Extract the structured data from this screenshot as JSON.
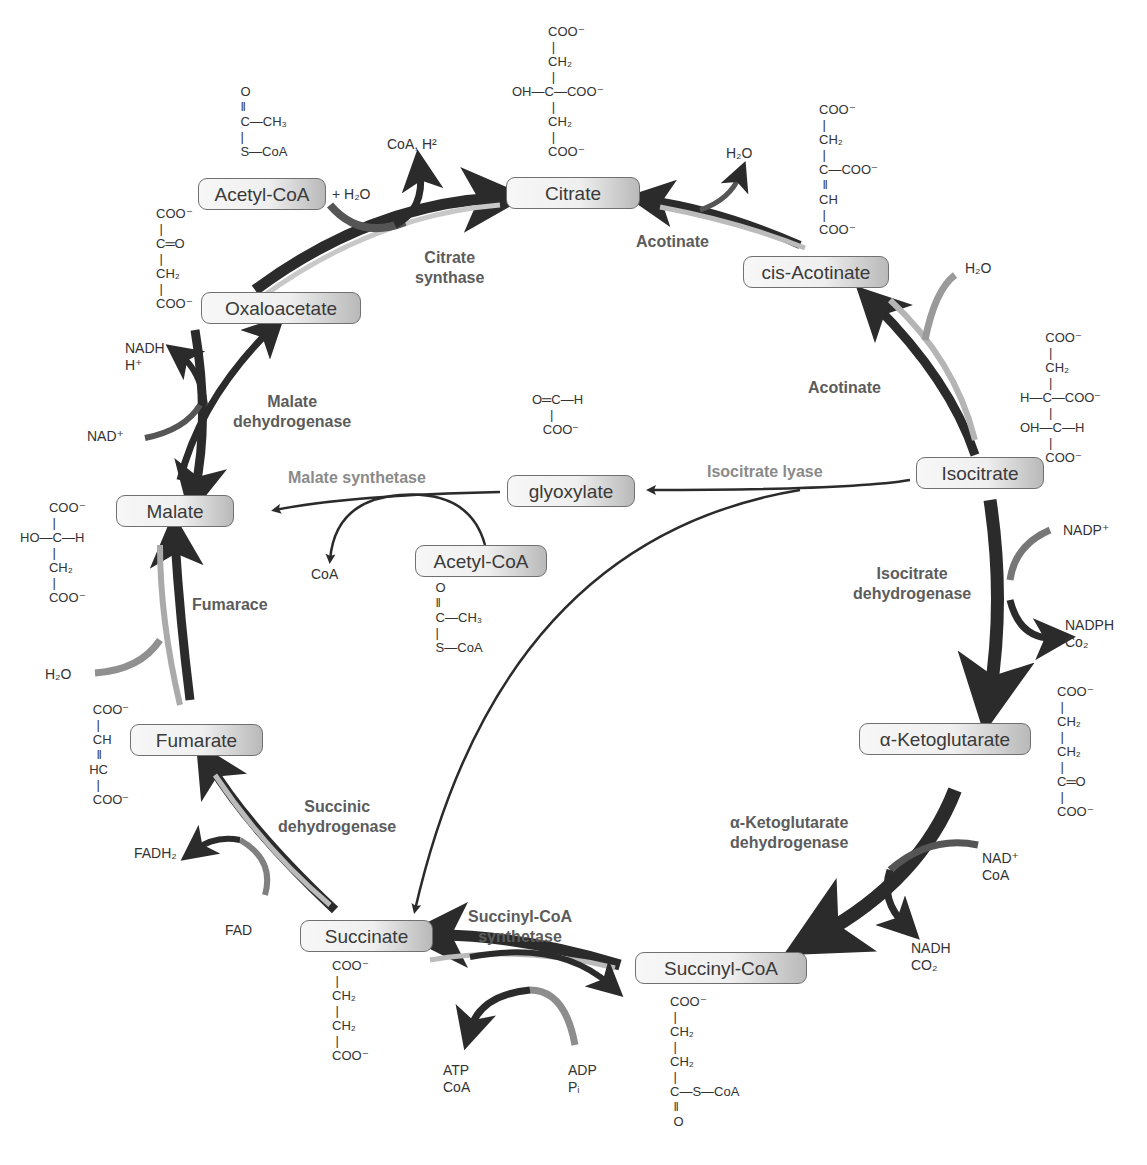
{
  "diagram": {
    "title_visible": false,
    "type": "metabolic-cycle"
  },
  "metabolites": {
    "acetyl_coa_top": "Acetyl-CoA",
    "citrate": "Citrate",
    "cis_acotinate": "cis-Acotinate",
    "isocitrate": "Isocitrate",
    "a_ketoglutarate": "α-Ketoglutarate",
    "succinyl_coa": "Succinyl-CoA",
    "succinate": "Succinate",
    "fumarate": "Fumarate",
    "malate": "Malate",
    "oxaloacetate": "Oxaloacetate",
    "glyoxylate": "glyoxylate",
    "acetyl_coa_mid": "Acetyl-CoA"
  },
  "enzymes": {
    "citrate_synthase": [
      "Citrate",
      "synthase"
    ],
    "acotinate_1": "Acotinate",
    "acotinate_2": "Acotinate",
    "isocitrate_dh": [
      "Isocitrate",
      "dehydrogenase"
    ],
    "akg_dh": [
      "α-Ketoglutarate",
      "dehydrogenase"
    ],
    "succinyl_coa_synthetase": [
      "Succinyl-CoA",
      "synthetase"
    ],
    "succinic_dh": [
      "Succinic",
      "dehydrogenase"
    ],
    "fumarace": "Fumarace",
    "malate_dh": [
      "Malate",
      "dehydrogenase"
    ],
    "malate_synthetase": "Malate synthetase",
    "isocitrate_lyase": "Isocitrate lyase"
  },
  "cofactors": {
    "plus_h2o": "+ H₂O",
    "coa_h": "CoA, H²",
    "h2o_citrate": "H₂O",
    "h2o_isocitrate": "H₂O",
    "nadp": "NADP⁺",
    "nadph": "NADPH",
    "co2_idh": "Co₂",
    "nad_akg": "NAD⁺",
    "coa_akg": "CoA",
    "nadh_akg": "NADH",
    "co2_akg": "CO₂",
    "atp": "ATP",
    "coa_scs": "CoA",
    "adp": "ADP",
    "pi": "Pᵢ",
    "fadh2": "FADH₂",
    "fad": "FAD",
    "h2o_fum": "H₂O",
    "nad_mdh": "NAD⁺",
    "nadh_mdh": "NADH",
    "h_mdh": "H⁺",
    "coa_ms": "CoA"
  },
  "structures": {
    "acetyl_coa_top": [
      "    O",
      "    ‖",
      "    C—CH₃",
      "    |",
      "    S—CoA"
    ],
    "citrate": [
      "          COO⁻",
      "           |",
      "          CH₂",
      "           |",
      "OH—C—COO⁻",
      "           |",
      "          CH₂",
      "           |",
      "          COO⁻"
    ],
    "cis_acotinate": [
      "COO⁻",
      " |",
      "CH₂",
      " |",
      "C—COO⁻",
      " ‖",
      "CH",
      " |",
      "COO⁻"
    ],
    "oxaloacetate": [
      "COO⁻",
      " |",
      "C═O",
      " |",
      "CH₂",
      " |",
      "COO⁻"
    ],
    "isocitrate": [
      "       COO⁻",
      "        |",
      "       CH₂",
      "        |",
      "H—C—COO⁻",
      "        |",
      "OH—C—H",
      "        |",
      "       COO⁻"
    ],
    "a_ketoglutarate": [
      "COO⁻",
      " |",
      "CH₂",
      " |",
      "CH₂",
      " |",
      "C═O",
      " |",
      "COO⁻"
    ],
    "succinyl_coa": [
      "COO⁻",
      " |",
      "CH₂",
      " |",
      "CH₂",
      " |",
      "C—S—CoA",
      " ‖",
      " O"
    ],
    "succinate": [
      "COO⁻",
      " |",
      "CH₂",
      " |",
      "CH₂",
      " |",
      "COO⁻"
    ],
    "fumarate": [
      "   COO⁻",
      "    |",
      "   CH",
      "    ‖",
      "  HC",
      "    |",
      "   COO⁻"
    ],
    "malate": [
      "        COO⁻",
      "         |",
      "HO—C—H",
      "         |",
      "        CH₂",
      "         |",
      "        COO⁻"
    ],
    "glyoxylate": [
      "O═C—H",
      "     |",
      "   COO⁻"
    ],
    "acetyl_coa_mid": [
      " O",
      " ‖",
      " C—CH₃",
      " |",
      " S—CoA"
    ]
  },
  "colors": {
    "arrow_dark": "#2b2b2b",
    "arrow_light": "#cfcfcf",
    "enzyme_text": "#5c5c5c",
    "enzyme_text_light": "#8a8a8a",
    "box_border": "#707070"
  }
}
